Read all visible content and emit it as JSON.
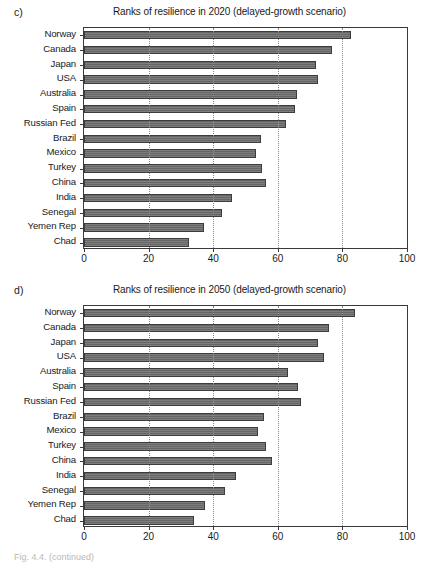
{
  "figure": {
    "panels": [
      {
        "letter": "c)",
        "title": "Ranks of resilience in 2020 (delayed-growth scenario)"
      },
      {
        "letter": "d)",
        "title": "Ranks of resilience in 2050 (delayed-growth scenario)"
      }
    ],
    "footer_caption": "Fig. 4.4. (continued)"
  },
  "axis": {
    "ticks": [
      "0",
      "20",
      "40",
      "60",
      "80",
      "100"
    ],
    "tick_values": [
      0,
      20,
      40,
      60,
      80,
      100
    ],
    "xmin": 0,
    "xmax": 100
  },
  "chart_data": [
    {
      "type": "bar",
      "orientation": "horizontal",
      "panel": "c",
      "title": "Ranks of resilience in 2020 (delayed-growth scenario)",
      "xlabel": "",
      "ylabel": "",
      "xlim": [
        0,
        100
      ],
      "grid": "vertical dotted gridlines at 20, 40, 60, 80",
      "legend": "none",
      "categories": [
        "Norway",
        "Canada",
        "Japan",
        "USA",
        "Australia",
        "Spain",
        "Russian Fed",
        "Brazil",
        "Mexico",
        "Turkey",
        "China",
        "India",
        "Senegal",
        "Yemen Rep",
        "Chad"
      ],
      "values": [
        82.8,
        76.8,
        71.8,
        72.6,
        65.8,
        65.3,
        62.5,
        54.9,
        53.4,
        55.1,
        56.3,
        45.8,
        42.7,
        37.1,
        32.6
      ]
    },
    {
      "type": "bar",
      "orientation": "horizontal",
      "panel": "d",
      "title": "Ranks of resilience in 2050 (delayed-growth scenario)",
      "xlabel": "",
      "ylabel": "",
      "xlim": [
        0,
        100
      ],
      "grid": "vertical dotted gridlines at 20, 40, 60, 80",
      "legend": "none",
      "categories": [
        "Norway",
        "Canada",
        "Japan",
        "USA",
        "Australia",
        "Spain",
        "Russian Fed",
        "Brazil",
        "Mexico",
        "Turkey",
        "China",
        "India",
        "Senegal",
        "Yemen Rep",
        "Chad"
      ],
      "values": [
        84.0,
        75.8,
        72.5,
        74.2,
        63.3,
        66.4,
        67.2,
        55.6,
        53.8,
        56.2,
        58.2,
        47.0,
        43.8,
        37.6,
        34.2
      ]
    }
  ],
  "colors": {
    "bar_fill": "#6e6e6e",
    "bar_border": "#3c3c3c",
    "axis": "#3a3a3a",
    "gridline": "#8a8a8a",
    "background": "#ffffff"
  }
}
